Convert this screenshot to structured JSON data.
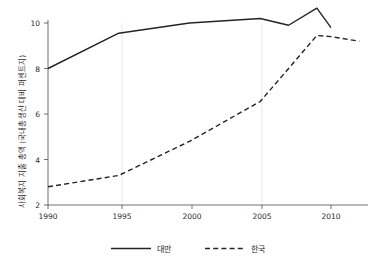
{
  "chart_data": {
    "type": "line",
    "title": "",
    "xlabel": "",
    "ylabel": "사회복지 지출 총액 (국내총생산 대비 퍼센트지)",
    "xlim": [
      1990,
      2012
    ],
    "ylim": [
      2,
      10.8
    ],
    "xticks": [
      1990,
      1995,
      2000,
      2005,
      2010
    ],
    "yticks": [
      2,
      4,
      6,
      8,
      10
    ],
    "grid": "vertical-light",
    "legend_position": "bottom-center",
    "series": [
      {
        "name": "대만",
        "style": "solid",
        "color": "#242424",
        "x": [
          1990,
          1995,
          2000,
          2005,
          2007,
          2009,
          2010
        ],
        "values": [
          8.0,
          9.55,
          10.0,
          10.2,
          9.9,
          10.65,
          9.8
        ]
      },
      {
        "name": "한국",
        "style": "dashed",
        "color": "#242424",
        "x": [
          1990,
          1995,
          2000,
          2005,
          2009,
          2010,
          2012
        ],
        "values": [
          2.8,
          3.3,
          4.8,
          6.55,
          9.45,
          9.4,
          9.2
        ]
      }
    ]
  },
  "axis": {
    "y_title": "사회복지 지출 총액 (국내총생산 대비 퍼센트지)",
    "y_tick_labels": [
      "10",
      "8",
      "6",
      "4",
      "2"
    ],
    "x_tick_labels": [
      "1990",
      "1995",
      "2000",
      "2005",
      "2010"
    ]
  },
  "legend": {
    "items": [
      {
        "label": "대만",
        "style": "solid"
      },
      {
        "label": "한국",
        "style": "dashed"
      }
    ]
  },
  "colors": {
    "line": "#242424",
    "axis": "#4d4d4d",
    "grid": "#e2e2e2",
    "background": "#ffffff"
  }
}
